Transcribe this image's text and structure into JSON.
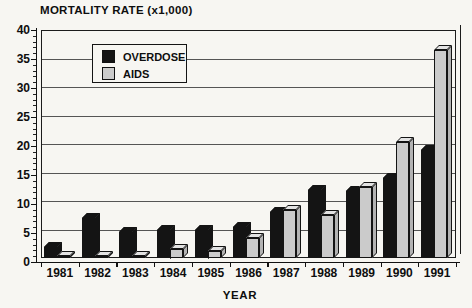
{
  "title": "MORTALITY RATE (x1,000)",
  "chart_data": {
    "type": "bar",
    "style": "3d-column",
    "title": "MORTALITY RATE (x1,000)",
    "xlabel": "YEAR",
    "ylabel": "MORTALITY RATE (x1,000)",
    "categories": [
      "1981",
      "1982",
      "1983",
      "1984",
      "1985",
      "1986",
      "1987",
      "1988",
      "1989",
      "1990",
      "1991"
    ],
    "series": [
      {
        "name": "OVERDOSE",
        "color": "#141414",
        "top_color": "#141414",
        "side_color": "#141414",
        "edge_color": "#141414",
        "values": [
          2,
          7,
          4.5,
          5,
          5,
          5.5,
          8,
          12,
          11.8,
          14,
          19
        ]
      },
      {
        "name": "AIDS",
        "color": "#cbcbcb",
        "top_color": "#e3e3e3",
        "side_color": "#b3b3b3",
        "edge_color": "#141414",
        "values": [
          0.3,
          0.3,
          0.3,
          1.5,
          1.3,
          3.5,
          8.5,
          7.5,
          12.5,
          20.3,
          36.5
        ]
      }
    ],
    "ylim": [
      0,
      40
    ],
    "yticks": [
      0,
      5,
      10,
      15,
      20,
      25,
      30,
      35,
      40
    ],
    "minor_tick_step": 1,
    "grid": true,
    "gridline_color": "#555555",
    "axis_color": "#111111",
    "legend_position": "top-left-inside"
  }
}
